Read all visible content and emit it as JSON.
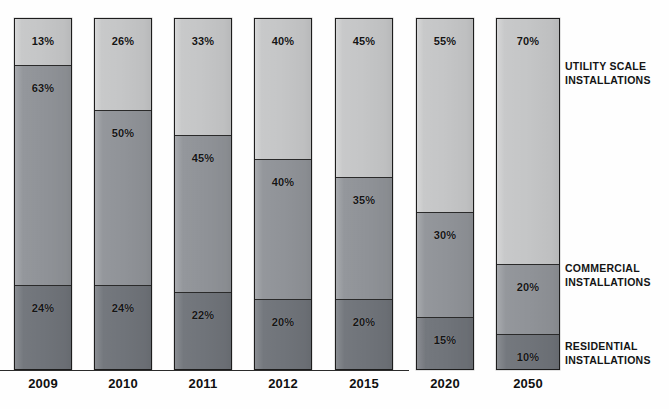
{
  "chart_data": {
    "type": "bar",
    "title": "",
    "subtitle": "",
    "xlabel": "",
    "ylabel": "",
    "ylim": [
      0,
      100
    ],
    "grid": false,
    "stacked": true,
    "stack_orientation": "vertical",
    "legend_position": "right",
    "categories": [
      "2009",
      "2010",
      "2011",
      "2012",
      "2015",
      "2020",
      "2050"
    ],
    "series": [
      {
        "name": "UTILITY SCALE INSTALLATIONS",
        "color": "#c5c6c7",
        "values": [
          13,
          26,
          33,
          40,
          45,
          55,
          70
        ],
        "labels": [
          "13%",
          "26%",
          "33%",
          "40%",
          "45%",
          "55%",
          "70%"
        ]
      },
      {
        "name": "COMMERCIAL INSTALLATIONS",
        "color": "#909398",
        "values": [
          63,
          50,
          45,
          40,
          35,
          30,
          20
        ],
        "labels": [
          "63%",
          "50%",
          "45%",
          "40%",
          "35%",
          "30%",
          "20%"
        ]
      },
      {
        "name": "RESIDENTIAL INSTALLATIONS",
        "color": "#70747a",
        "values": [
          24,
          24,
          22,
          20,
          20,
          15,
          10
        ],
        "labels": [
          "24%",
          "24%",
          "22%",
          "20%",
          "20%",
          "15%",
          "10%"
        ]
      }
    ]
  },
  "legend": {
    "utility": {
      "line1": "UTILITY SCALE",
      "line2": "INSTALLATIONS"
    },
    "commercial": {
      "line1": "COMMERCIAL",
      "line2": "INSTALLATIONS"
    },
    "residential": {
      "line1": "RESIDENTIAL",
      "line2": "INSTALLATIONS"
    }
  },
  "layout": {
    "bars": [
      {
        "left": 14,
        "width": 58,
        "top": 18
      },
      {
        "left": 94,
        "width": 58,
        "top": 18
      },
      {
        "left": 174,
        "width": 58,
        "top": 18
      },
      {
        "left": 254,
        "width": 58,
        "top": 18
      },
      {
        "left": 335,
        "width": 58,
        "top": 18
      },
      {
        "left": 416,
        "width": 58,
        "top": 18
      },
      {
        "left": 496,
        "width": 64,
        "top": 18
      }
    ],
    "bar_bottom": 370,
    "axis_line_width": 409
  }
}
